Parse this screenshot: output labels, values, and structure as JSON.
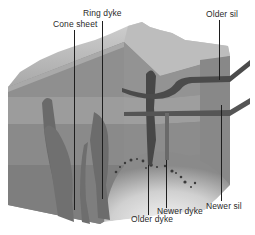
{
  "diagram": {
    "labels": {
      "cone_sheet": "Cone sheet",
      "ring_dyke": "Ring dyke",
      "older_sil": "Older sil",
      "newer_sil": "Newer sil",
      "newer_dyke": "Newer dyke",
      "older_dyke": "Older dyke"
    },
    "colors": {
      "background": "#ffffff",
      "mountain_light": "#d6d6d6",
      "mountain_dark": "#9e9e9e",
      "layer_top": "#8e8e8e",
      "layer_mid": "#9a9a9a",
      "layer_low": "#858585",
      "layer_base": "#7c7c7c",
      "side_face": "#888888",
      "intrusion": "#5e5e5e",
      "sill": "#4a4a4a",
      "magma_chamber": "#e8e8e8",
      "leader_line": "#1e1e1e",
      "label_text": "#2a2a2a"
    }
  }
}
